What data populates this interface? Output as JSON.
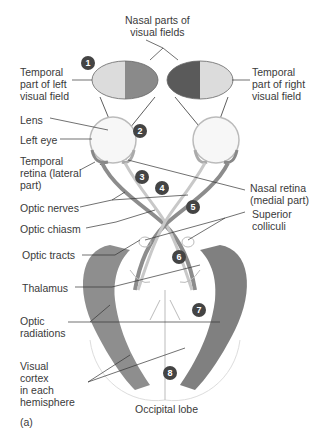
{
  "labels": {
    "nasal_fields": "Nasal parts of\nvisual fields",
    "temporal_left": "Temporal\npart of left\nvisual field",
    "temporal_right": "Temporal\npart of right\nvisual field",
    "lens": "Lens",
    "left_eye": "Left eye",
    "temporal_retina": "Temporal\nretina (lateral\npart)",
    "nasal_retina": "Nasal retina\n(medial part)",
    "optic_nerves": "Optic nerves",
    "optic_chiasm": "Optic chiasm",
    "superior_colliculi": "Superior\ncolliculi",
    "optic_tracts": "Optic tracts",
    "thalamus": "Thalamus",
    "optic_radiations": "Optic\nradiations",
    "visual_cortex": "Visual\ncortex\nin each\nhemisphere",
    "occipital_lobe": "Occipital lobe",
    "panel": "(a)"
  },
  "steps": [
    "1",
    "2",
    "3",
    "4",
    "5",
    "6",
    "7",
    "8"
  ],
  "colors": {
    "field_light": "#d9d9d9",
    "field_mid": "#8a8a8a",
    "field_dark": "#5a5a5a",
    "tract": "#8c8c8c",
    "cortex": "#6e6e6e",
    "line": "#333333",
    "badge": "#444444"
  }
}
